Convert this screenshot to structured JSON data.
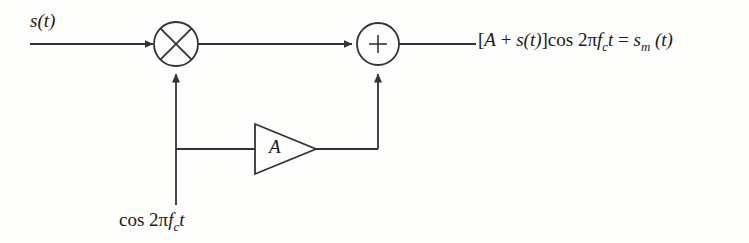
{
  "diagram": {
    "stroke_color": "#333333",
    "text_color": "#1a1a1a",
    "background_color": "#fdfdfc",
    "input": {
      "label_plain": "s(t)",
      "label_var": "s",
      "label_arg": "(t)"
    },
    "multiplier": {
      "symbol": "multiply-circle",
      "glyph": "⊗"
    },
    "summer": {
      "symbol": "sum-circle",
      "glyph": "+",
      "sign": "+"
    },
    "amplifier": {
      "symbol": "triangle-amplifier",
      "gain_label": "A"
    },
    "carrier": {
      "prefix": "cos 2π",
      "freq_var": "f",
      "freq_sub": "c",
      "time_var": "t",
      "full": "cos 2πfₑt"
    },
    "output": {
      "dash": "—",
      "bracket_open": "[",
      "gain": "A",
      "plus": "+",
      "signal_var": "s",
      "signal_arg": "(t)",
      "bracket_close": "]",
      "cos": "cos",
      "two_pi": "2π",
      "freq_var": "f",
      "freq_sub": "c",
      "time_var": "t",
      "equals": "=",
      "result_var": "s",
      "result_sub": "m",
      "result_arg": "(t)",
      "full": "[A + s(t)] cos 2πfₑt = sₘ(t)"
    }
  }
}
